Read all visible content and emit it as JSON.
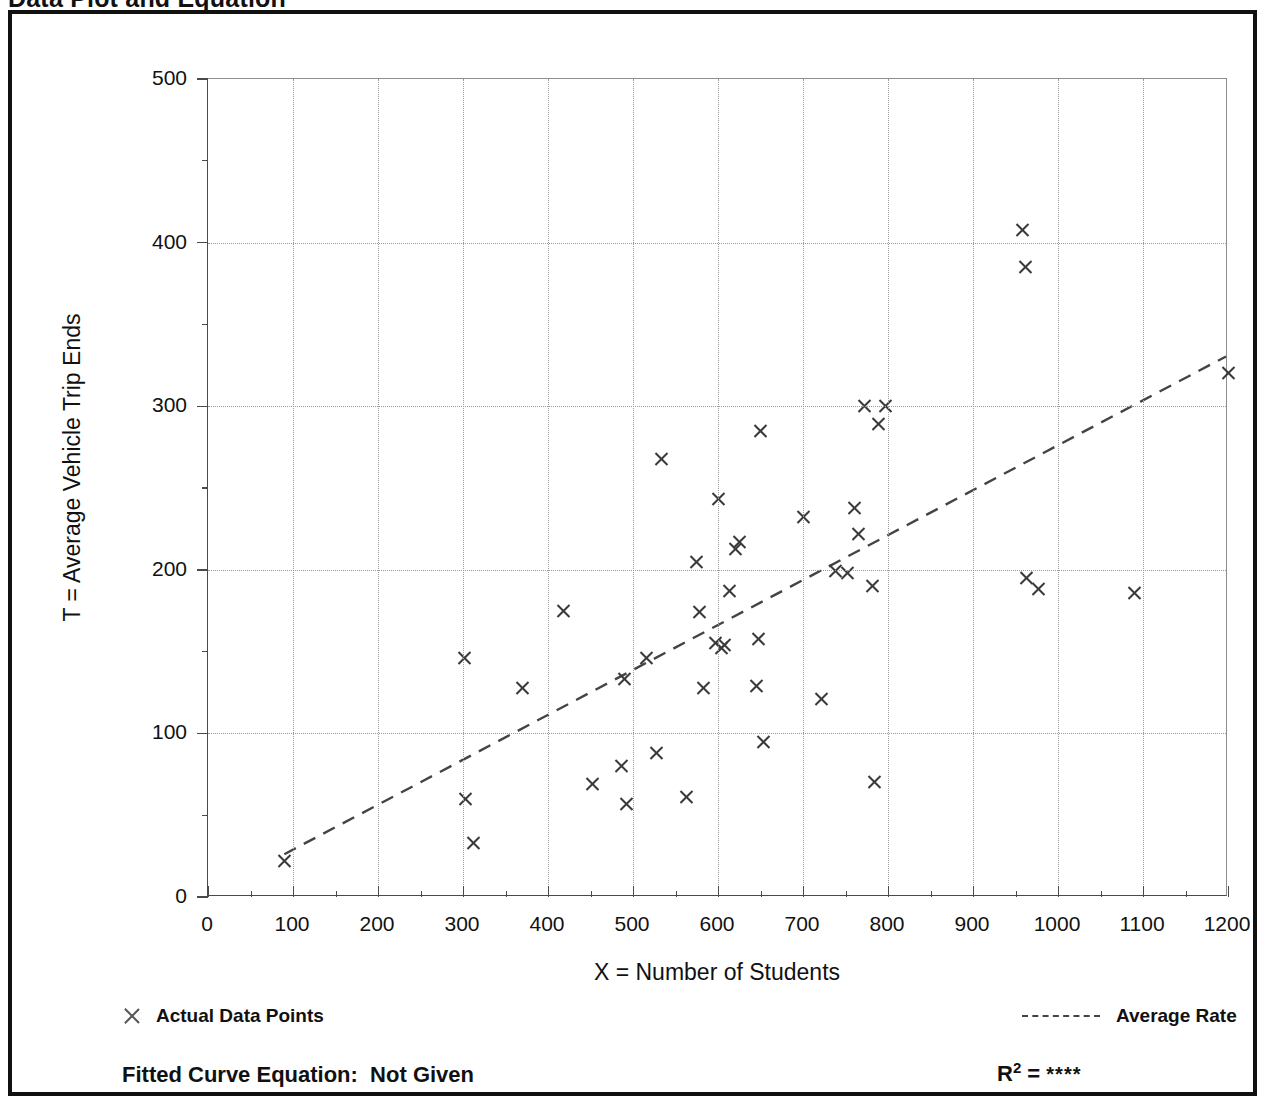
{
  "page": {
    "title": "Data Plot and Equation"
  },
  "chart_data": {
    "type": "scatter",
    "title": "Data Plot and Equation",
    "xlabel": "X = Number of Students",
    "ylabel": "T = Average Vehicle Trip Ends",
    "xlim": [
      0,
      1200
    ],
    "ylim": [
      0,
      500
    ],
    "x_major_step": 100,
    "x_minor_step": 50,
    "y_major_step": 100,
    "y_minor_step": 50,
    "grid": true,
    "legend_position": "below-axes",
    "x_ticks": [
      0,
      100,
      200,
      300,
      400,
      500,
      600,
      700,
      800,
      900,
      1000,
      1100,
      1200
    ],
    "y_ticks": [
      0,
      100,
      200,
      300,
      400,
      500
    ],
    "series": [
      {
        "name": "Actual Data Points",
        "marker": "x",
        "color": "#3a3a3a",
        "points": [
          [
            90,
            22
          ],
          [
            302,
            146
          ],
          [
            303,
            60
          ],
          [
            312,
            33
          ],
          [
            370,
            128
          ],
          [
            418,
            175
          ],
          [
            452,
            69
          ],
          [
            486,
            80
          ],
          [
            490,
            133
          ],
          [
            492,
            57
          ],
          [
            516,
            146
          ],
          [
            528,
            88
          ],
          [
            533,
            268
          ],
          [
            563,
            61
          ],
          [
            575,
            205
          ],
          [
            578,
            174
          ],
          [
            583,
            128
          ],
          [
            597,
            155
          ],
          [
            600,
            243
          ],
          [
            604,
            152
          ],
          [
            608,
            154
          ],
          [
            614,
            187
          ],
          [
            621,
            213
          ],
          [
            625,
            217
          ],
          [
            645,
            129
          ],
          [
            648,
            158
          ],
          [
            650,
            285
          ],
          [
            653,
            95
          ],
          [
            700,
            232
          ],
          [
            722,
            121
          ],
          [
            738,
            199
          ],
          [
            752,
            198
          ],
          [
            760,
            238
          ],
          [
            765,
            222
          ],
          [
            772,
            300
          ],
          [
            782,
            190
          ],
          [
            784,
            70
          ],
          [
            789,
            289
          ],
          [
            797,
            300
          ],
          [
            958,
            408
          ],
          [
            962,
            385
          ],
          [
            963,
            195
          ],
          [
            977,
            188
          ],
          [
            1090,
            186
          ],
          [
            1200,
            320
          ]
        ]
      }
    ],
    "trend": {
      "name": "Average Rate",
      "style": "dashed",
      "color": "#444444",
      "x_start": 90,
      "y_start": 25,
      "x_end": 1200,
      "y_end": 330
    },
    "annotations": {
      "equation_label": "Fitted Curve Equation:  Not Given",
      "r2_label": "R",
      "r2_exponent": "2",
      "r2_equals": " = ",
      "r2_value": "****"
    }
  },
  "legend": {
    "points_label": "Actual Data Points",
    "rate_label": "Average Rate"
  }
}
